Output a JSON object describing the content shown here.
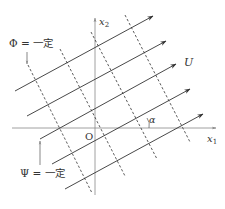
{
  "diagram": {
    "axes": {
      "x1_label": "x",
      "x1_sub": "1",
      "x2_label": "x",
      "x2_sub": "2",
      "origin_label": "O"
    },
    "labels": {
      "phi": "Φ = 一定",
      "psi": "Ψ = 一定",
      "flow": "U",
      "angle": "α"
    },
    "colors": {
      "line": "#333333",
      "axis": "#888888",
      "background": "#ffffff"
    },
    "streamlines": [
      {
        "x1": 15,
        "y1": 91,
        "x2": 153,
        "y2": 16
      },
      {
        "x1": 27,
        "y1": 116,
        "x2": 166,
        "y2": 41
      },
      {
        "x1": 40,
        "y1": 139,
        "x2": 176,
        "y2": 64
      },
      {
        "x1": 52,
        "y1": 164,
        "x2": 190,
        "y2": 89
      },
      {
        "x1": 65,
        "y1": 189,
        "x2": 203,
        "y2": 114
      }
    ],
    "equipotentials": [
      {
        "x1": 28,
        "y1": 65,
        "x2": 92,
        "y2": 193
      },
      {
        "x1": 60,
        "y1": 49,
        "x2": 125,
        "y2": 176
      },
      {
        "x1": 91,
        "y1": 32,
        "x2": 157,
        "y2": 159
      },
      {
        "x1": 125,
        "y1": 15,
        "x2": 190,
        "y2": 142
      }
    ]
  }
}
